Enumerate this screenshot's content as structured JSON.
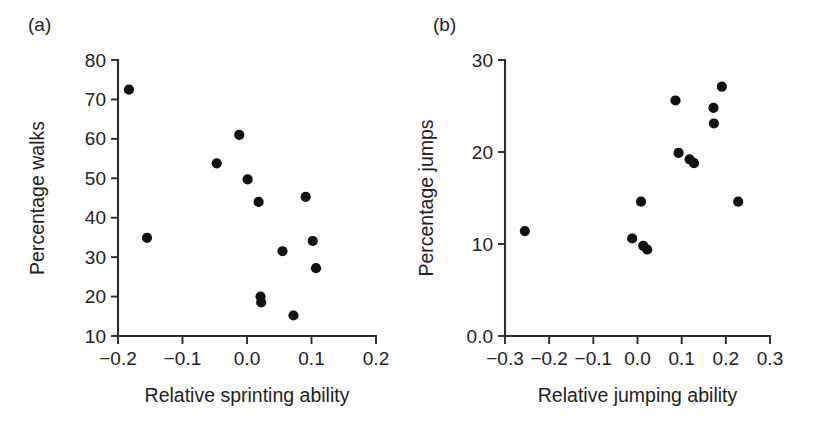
{
  "figure": {
    "background": "#ffffff",
    "marker_color": "#111111",
    "axis_color": "#2b2b2b",
    "text_color": "#222222"
  },
  "panels": [
    {
      "label": "(a)",
      "xlabel": "Relative sprinting ability",
      "ylabel": "Percentage walks",
      "xticks": [
        "−0.2",
        "−0.1",
        "0.0",
        "0.1",
        "0.2"
      ],
      "yticks": [
        "80",
        "70",
        "60",
        "50",
        "40",
        "30",
        "20",
        "10"
      ]
    },
    {
      "label": "(b)",
      "xlabel": "Relative jumping ability",
      "ylabel": "Percentage jumps",
      "xticks": [
        "−0.3",
        "−0.2",
        "−0.1",
        "0.0",
        "0.1",
        "0.2",
        "0.3"
      ],
      "yticks": [
        "30",
        "20",
        "10",
        "0.0"
      ]
    }
  ],
  "chart_data": [
    {
      "type": "scatter",
      "panel": "(a)",
      "title": "",
      "xlabel": "Relative sprinting ability",
      "ylabel": "Percentage walks",
      "xlim": [
        -0.2,
        0.2
      ],
      "ylim": [
        10,
        80
      ],
      "xticks": [
        -0.2,
        -0.1,
        0.0,
        0.1,
        0.2
      ],
      "yticks": [
        10,
        20,
        30,
        40,
        50,
        60,
        70,
        80
      ],
      "grid": false,
      "legend": false,
      "series": [
        {
          "name": "lizards",
          "marker": "filled-circle",
          "color": "#111111",
          "points": [
            {
              "x": -0.183,
              "y": 72.5
            },
            {
              "x": -0.155,
              "y": 34.9
            },
            {
              "x": -0.047,
              "y": 53.8
            },
            {
              "x": -0.012,
              "y": 61.0
            },
            {
              "x": 0.001,
              "y": 49.7
            },
            {
              "x": 0.018,
              "y": 44.0
            },
            {
              "x": 0.021,
              "y": 20.0
            },
            {
              "x": 0.022,
              "y": 18.5
            },
            {
              "x": 0.055,
              "y": 31.5
            },
            {
              "x": 0.072,
              "y": 15.2
            },
            {
              "x": 0.091,
              "y": 45.3
            },
            {
              "x": 0.102,
              "y": 34.1
            },
            {
              "x": 0.107,
              "y": 27.2
            }
          ]
        }
      ]
    },
    {
      "type": "scatter",
      "panel": "(b)",
      "title": "",
      "xlabel": "Relative jumping ability",
      "ylabel": "Percentage jumps",
      "xlim": [
        -0.3,
        0.3
      ],
      "ylim": [
        0,
        30
      ],
      "xticks": [
        -0.3,
        -0.2,
        -0.1,
        0.0,
        0.1,
        0.2,
        0.3
      ],
      "yticks": [
        0,
        10,
        20,
        30
      ],
      "grid": false,
      "legend": false,
      "series": [
        {
          "name": "lizards",
          "marker": "filled-circle",
          "color": "#111111",
          "points": [
            {
              "x": -0.255,
              "y": 11.4
            },
            {
              "x": -0.012,
              "y": 10.6
            },
            {
              "x": 0.013,
              "y": 9.8
            },
            {
              "x": 0.022,
              "y": 9.4
            },
            {
              "x": 0.008,
              "y": 14.6
            },
            {
              "x": 0.086,
              "y": 25.6
            },
            {
              "x": 0.093,
              "y": 19.9
            },
            {
              "x": 0.118,
              "y": 19.2
            },
            {
              "x": 0.128,
              "y": 18.8
            },
            {
              "x": 0.172,
              "y": 24.8
            },
            {
              "x": 0.173,
              "y": 23.1
            },
            {
              "x": 0.191,
              "y": 27.1
            },
            {
              "x": 0.228,
              "y": 14.6
            }
          ]
        }
      ]
    }
  ]
}
